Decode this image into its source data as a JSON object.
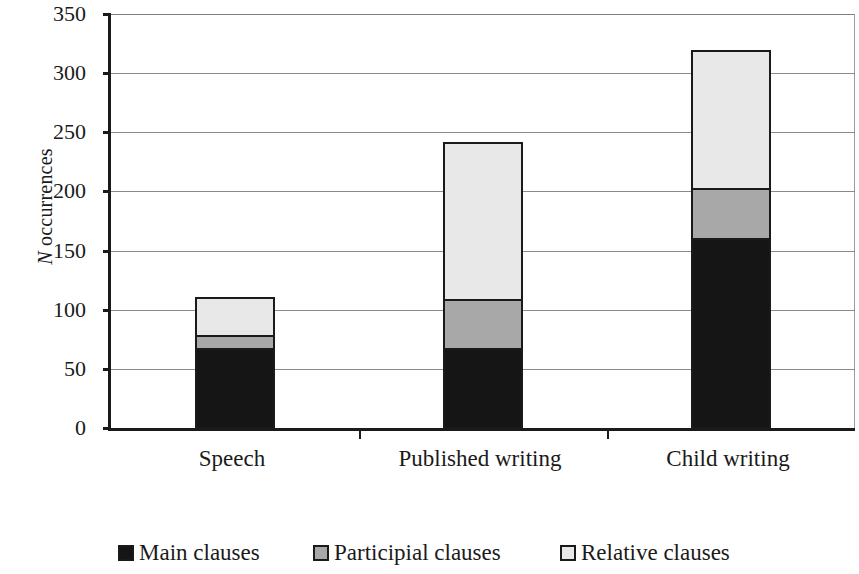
{
  "chart_data": {
    "type": "bar",
    "subtype": "stacked",
    "title": "",
    "xlabel": "",
    "ylabel": "N occurrences",
    "ylabel_italic_prefix": "N",
    "ylabel_rest": " occurrences",
    "categories": [
      "Speech",
      "Published writing",
      "Child writing"
    ],
    "series": [
      {
        "name": "Main clauses",
        "color": "#151515",
        "values": [
          67,
          67,
          160
        ]
      },
      {
        "name": "Participial clauses",
        "color": "#a8a8a8",
        "values": [
          11,
          41,
          42
        ]
      },
      {
        "name": "Relative clauses",
        "color": "#e8e8e8",
        "values": [
          32,
          133,
          117
        ]
      }
    ],
    "totals": [
      110,
      241,
      319
    ],
    "ylim": [
      0,
      350
    ],
    "ytick_values": [
      350,
      300,
      250,
      200,
      150,
      100,
      50,
      0
    ],
    "ytick_labels": [
      "350",
      "300",
      "250",
      "200",
      "150",
      "100",
      "50",
      "0"
    ],
    "grid": true,
    "grid_axis": "y",
    "legend_position": "bottom",
    "legend": [
      {
        "label": "Main clauses",
        "color": "#151515"
      },
      {
        "label": "Participial clauses",
        "color": "#a8a8a8"
      },
      {
        "label": "Relative clauses",
        "color": "#e8e8e8"
      }
    ],
    "bar_outline_color": "#1a1a1a",
    "axis_color": "#1a1a1a",
    "gridline_color": "#8a8a8a",
    "background_color": "#ffffff"
  }
}
